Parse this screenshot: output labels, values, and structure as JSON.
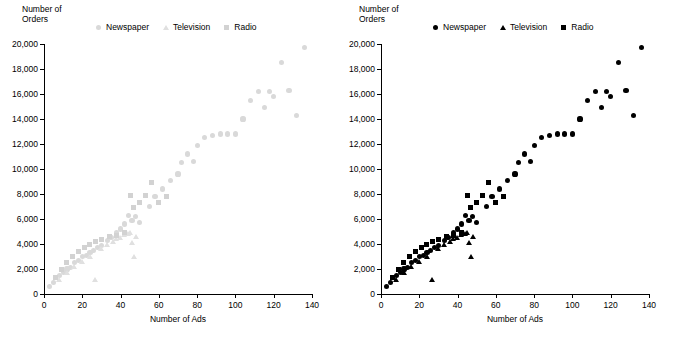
{
  "chart_data": [
    {
      "id": "left",
      "type": "scatter",
      "title": "",
      "ylabel": "Number of Orders",
      "xlabel": "Number of Ads",
      "xlim": [
        0,
        140
      ],
      "ylim": [
        0,
        20000
      ],
      "xticks": [
        0,
        20,
        40,
        60,
        80,
        100,
        120,
        140
      ],
      "yticks": [
        0,
        2000,
        4000,
        6000,
        8000,
        10000,
        12000,
        14000,
        16000,
        18000,
        20000
      ],
      "ytick_labels": [
        "0",
        "2,000",
        "4,000",
        "6,000",
        "8,000",
        "10,000",
        "12,000",
        "14,000",
        "16,000",
        "18,000",
        "20,000"
      ],
      "xtick_labels": [
        "0",
        "20",
        "40",
        "60",
        "80",
        "100",
        "120",
        "140"
      ],
      "grid": false,
      "legend_position": "top",
      "marker_style": "light-gray, all series same shape",
      "series": [
        {
          "name": "Newspaper",
          "marker": "circle",
          "color": "#d9d9d9",
          "points": [
            [
              3,
              600
            ],
            [
              5,
              900
            ],
            [
              8,
              1500
            ],
            [
              10,
              1700
            ],
            [
              12,
              2000
            ],
            [
              14,
              2100
            ],
            [
              16,
              2500
            ],
            [
              18,
              2700
            ],
            [
              20,
              3000
            ],
            [
              22,
              3100
            ],
            [
              24,
              3300
            ],
            [
              26,
              3500
            ],
            [
              28,
              3700
            ],
            [
              30,
              3900
            ],
            [
              33,
              4300
            ],
            [
              35,
              4500
            ],
            [
              38,
              4900
            ],
            [
              40,
              5200
            ],
            [
              42,
              5600
            ],
            [
              44,
              6300
            ],
            [
              46,
              5900
            ],
            [
              48,
              6200
            ],
            [
              50,
              5700
            ],
            [
              55,
              7000
            ],
            [
              58,
              7800
            ],
            [
              62,
              8400
            ],
            [
              66,
              9100
            ],
            [
              70,
              9600
            ],
            [
              72,
              10500
            ],
            [
              75,
              11200
            ],
            [
              78,
              10600
            ],
            [
              80,
              11900
            ],
            [
              84,
              12500
            ],
            [
              88,
              12700
            ],
            [
              92,
              12800
            ],
            [
              96,
              12800
            ],
            [
              100,
              12800
            ],
            [
              104,
              14000
            ],
            [
              108,
              15500
            ],
            [
              112,
              16200
            ],
            [
              115,
              14900
            ],
            [
              118,
              16200
            ],
            [
              120,
              15800
            ],
            [
              124,
              18500
            ],
            [
              128,
              16300
            ],
            [
              132,
              14300
            ],
            [
              136,
              19700
            ]
          ]
        },
        {
          "name": "Television",
          "marker": "triangle",
          "color": "#e0e0e0",
          "points": [
            [
              8,
              1100
            ],
            [
              12,
              1700
            ],
            [
              16,
              2200
            ],
            [
              20,
              2600
            ],
            [
              24,
              3000
            ],
            [
              27,
              1100
            ],
            [
              30,
              3600
            ],
            [
              33,
              3900
            ],
            [
              36,
              4200
            ],
            [
              38,
              4400
            ],
            [
              40,
              4500
            ],
            [
              42,
              4700
            ],
            [
              44,
              4800
            ],
            [
              45,
              4900
            ],
            [
              46,
              4100
            ],
            [
              47,
              3000
            ],
            [
              48,
              4600
            ]
          ]
        },
        {
          "name": "Radio",
          "marker": "square",
          "color": "#d2d2d2",
          "points": [
            [
              6,
              1300
            ],
            [
              9,
              2000
            ],
            [
              12,
              2500
            ],
            [
              15,
              3000
            ],
            [
              18,
              3400
            ],
            [
              21,
              3700
            ],
            [
              24,
              4000
            ],
            [
              27,
              4200
            ],
            [
              30,
              4400
            ],
            [
              34,
              4600
            ],
            [
              38,
              4700
            ],
            [
              42,
              4900
            ],
            [
              45,
              7900
            ],
            [
              47,
              6900
            ],
            [
              50,
              7300
            ],
            [
              53,
              7900
            ],
            [
              56,
              8900
            ],
            [
              60,
              7300
            ],
            [
              64,
              7800
            ]
          ]
        }
      ]
    },
    {
      "id": "right",
      "type": "scatter",
      "title": "",
      "ylabel": "Number of Orders",
      "xlabel": "Number of Ads",
      "xlim": [
        0,
        140
      ],
      "ylim": [
        0,
        20000
      ],
      "xticks": [
        0,
        20,
        40,
        60,
        80,
        100,
        120,
        140
      ],
      "yticks": [
        0,
        2000,
        4000,
        6000,
        8000,
        10000,
        12000,
        14000,
        16000,
        18000,
        20000
      ],
      "ytick_labels": [
        "0",
        "2,000",
        "4,000",
        "6,000",
        "8,000",
        "10,000",
        "12,000",
        "14,000",
        "16,000",
        "18,000",
        "20,000"
      ],
      "xtick_labels": [
        "0",
        "20",
        "40",
        "60",
        "80",
        "100",
        "120",
        "140"
      ],
      "grid": false,
      "legend_position": "top",
      "marker_style": "black, distinct shape per series",
      "series": [
        {
          "name": "Newspaper",
          "marker": "circle",
          "color": "#000000",
          "points": [
            [
              3,
              600
            ],
            [
              5,
              900
            ],
            [
              8,
              1500
            ],
            [
              10,
              1700
            ],
            [
              12,
              2000
            ],
            [
              14,
              2100
            ],
            [
              16,
              2500
            ],
            [
              18,
              2700
            ],
            [
              20,
              3000
            ],
            [
              22,
              3100
            ],
            [
              24,
              3300
            ],
            [
              26,
              3500
            ],
            [
              28,
              3700
            ],
            [
              30,
              3900
            ],
            [
              33,
              4300
            ],
            [
              35,
              4500
            ],
            [
              38,
              4900
            ],
            [
              40,
              5200
            ],
            [
              42,
              5600
            ],
            [
              44,
              6300
            ],
            [
              46,
              5900
            ],
            [
              48,
              6200
            ],
            [
              50,
              5700
            ],
            [
              55,
              7000
            ],
            [
              58,
              7800
            ],
            [
              62,
              8400
            ],
            [
              66,
              9100
            ],
            [
              70,
              9600
            ],
            [
              72,
              10500
            ],
            [
              75,
              11200
            ],
            [
              78,
              10600
            ],
            [
              80,
              11900
            ],
            [
              84,
              12500
            ],
            [
              88,
              12700
            ],
            [
              92,
              12800
            ],
            [
              96,
              12800
            ],
            [
              100,
              12800
            ],
            [
              104,
              14000
            ],
            [
              108,
              15500
            ],
            [
              112,
              16200
            ],
            [
              115,
              14900
            ],
            [
              118,
              16200
            ],
            [
              120,
              15800
            ],
            [
              124,
              18500
            ],
            [
              128,
              16300
            ],
            [
              132,
              14300
            ],
            [
              136,
              19700
            ]
          ]
        },
        {
          "name": "Television",
          "marker": "triangle",
          "color": "#000000",
          "points": [
            [
              8,
              1100
            ],
            [
              12,
              1700
            ],
            [
              16,
              2200
            ],
            [
              20,
              2600
            ],
            [
              24,
              3000
            ],
            [
              27,
              1100
            ],
            [
              30,
              3600
            ],
            [
              33,
              3900
            ],
            [
              36,
              4200
            ],
            [
              38,
              4400
            ],
            [
              40,
              4500
            ],
            [
              42,
              4700
            ],
            [
              44,
              4800
            ],
            [
              45,
              4900
            ],
            [
              46,
              4100
            ],
            [
              47,
              3000
            ],
            [
              48,
              4600
            ]
          ]
        },
        {
          "name": "Radio",
          "marker": "square",
          "color": "#000000",
          "points": [
            [
              6,
              1300
            ],
            [
              9,
              2000
            ],
            [
              12,
              2500
            ],
            [
              15,
              3000
            ],
            [
              18,
              3400
            ],
            [
              21,
              3700
            ],
            [
              24,
              4000
            ],
            [
              27,
              4200
            ],
            [
              30,
              4400
            ],
            [
              34,
              4600
            ],
            [
              38,
              4700
            ],
            [
              42,
              4900
            ],
            [
              45,
              7900
            ],
            [
              47,
              6900
            ],
            [
              50,
              7300
            ],
            [
              53,
              7900
            ],
            [
              56,
              8900
            ],
            [
              60,
              7300
            ],
            [
              64,
              7800
            ]
          ]
        }
      ]
    }
  ]
}
